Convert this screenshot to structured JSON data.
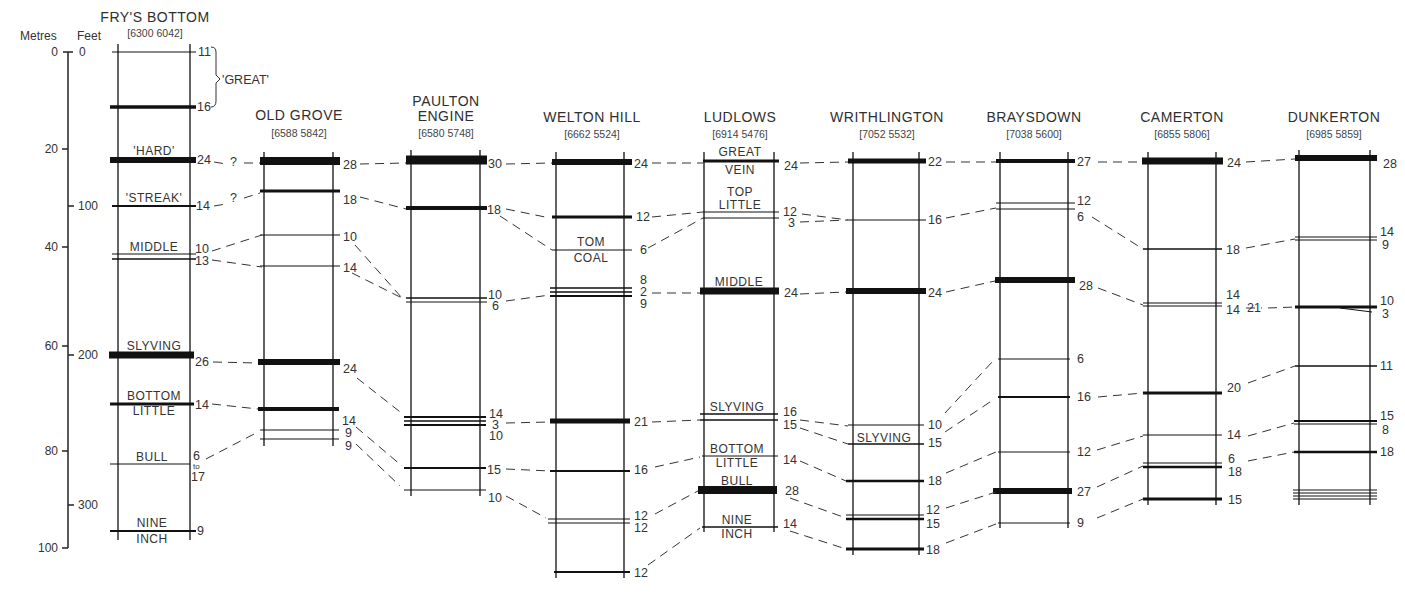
{
  "diagram": {
    "type": "stratigraphic-correlation",
    "scale": {
      "metres_label": "Metres",
      "feet_label": "Feet",
      "metres_ticks": [
        0,
        20,
        40,
        60,
        80,
        100
      ],
      "feet_ticks": [
        0,
        100,
        200,
        300
      ]
    },
    "columns": [
      {
        "id": "frys-bottom",
        "name": "FRY'S BOTTOM",
        "grid_ref": "[6300 6042]",
        "seams": [
          {
            "y": 52,
            "thick": 11,
            "w": 1,
            "label": ""
          },
          {
            "y": 107,
            "thick": 16,
            "w": 3.5,
            "label": ""
          },
          {
            "y": 160,
            "thick": 24,
            "w": 6,
            "label": "'HARD'"
          },
          {
            "y": 206,
            "thick": 14,
            "w": 2,
            "label": "'STREAK'"
          },
          {
            "y": 254,
            "thick": 10,
            "w": 1,
            "label": "MIDDLE"
          },
          {
            "y": 259,
            "thick": 13,
            "w": 1.5,
            "label": ""
          },
          {
            "y": 355,
            "thick": 26,
            "w": 7,
            "label": "SLYVING"
          },
          {
            "y": 404,
            "thick": 14,
            "w": 3,
            "label": "BOTTOM LITTLE"
          },
          {
            "y": 464,
            "thick": "6 to 17",
            "w": 1,
            "label": "BULL"
          },
          {
            "y": 531,
            "thick": 9,
            "w": 2,
            "label": "NINE INCH"
          }
        ],
        "bracket_label": "'GREAT'"
      },
      {
        "id": "old-grove",
        "name": "OLD GROVE",
        "grid_ref": "[6588 5842]",
        "seams": [
          {
            "y": 161,
            "thick": 28,
            "w": 8
          },
          {
            "y": 191,
            "thick": 18,
            "w": 3
          },
          {
            "y": 235,
            "thick": 10,
            "w": 1
          },
          {
            "y": 266,
            "thick": 14,
            "w": 1
          },
          {
            "y": 362,
            "thick": 24,
            "w": 6
          },
          {
            "y": 409,
            "thick": 14,
            "w": 4
          },
          {
            "y": 430,
            "thick": 9,
            "w": 1
          },
          {
            "y": 439,
            "thick": 9,
            "w": 1
          }
        ]
      },
      {
        "id": "paulton-engine",
        "name": "PAULTON ENGINE",
        "grid_ref": "[6580 5748]",
        "seams": [
          {
            "y": 160,
            "thick": 30,
            "w": 9
          },
          {
            "y": 208,
            "thick": 18,
            "w": 4
          },
          {
            "y": 298,
            "thick": 10,
            "w": 1.5
          },
          {
            "y": 301,
            "thick": 6,
            "w": 1
          },
          {
            "y": 417,
            "thick": 14,
            "w": 2
          },
          {
            "y": 421,
            "thick": 3,
            "w": 1.5
          },
          {
            "y": 425,
            "thick": 10,
            "w": 2
          },
          {
            "y": 468,
            "thick": 15,
            "w": 2
          },
          {
            "y": 490,
            "thick": 10,
            "w": 1
          }
        ]
      },
      {
        "id": "welton-hill",
        "name": "WELTON HILL",
        "grid_ref": "[6662 5524]",
        "seams": [
          {
            "y": 162,
            "thick": 24,
            "w": 6
          },
          {
            "y": 217,
            "thick": 12,
            "w": 3
          },
          {
            "y": 250,
            "thick": 6,
            "w": 1,
            "label": "TOM COAL"
          },
          {
            "y": 288,
            "thick": 8,
            "w": 1.5
          },
          {
            "y": 292,
            "thick": 2,
            "w": 1.5
          },
          {
            "y": 296,
            "thick": 9,
            "w": 2
          },
          {
            "y": 421,
            "thick": 21,
            "w": 5
          },
          {
            "y": 471,
            "thick": 16,
            "w": 2
          },
          {
            "y": 519,
            "thick": 12,
            "w": 1
          },
          {
            "y": 523,
            "thick": 12,
            "w": 1
          },
          {
            "y": 572,
            "thick": 12,
            "w": 2
          }
        ]
      },
      {
        "id": "ludlows",
        "name": "LUDLOWS",
        "grid_ref": "[6914 5476]",
        "seams": [
          {
            "y": 161,
            "thick": 24,
            "w": 3,
            "label": "GREAT VEIN"
          },
          {
            "y": 212,
            "thick": 12,
            "w": 1,
            "label": "TOP LITTLE"
          },
          {
            "y": 218,
            "thick": 3,
            "w": 1
          },
          {
            "y": 291,
            "thick": 24,
            "w": 7,
            "label": "MIDDLE"
          },
          {
            "y": 414,
            "thick": 16,
            "w": 1.5,
            "label": "SLYVING"
          },
          {
            "y": 420,
            "thick": 15,
            "w": 1.5
          },
          {
            "y": 456,
            "thick": 14,
            "w": 1,
            "label": "BOTTOM LITTLE"
          },
          {
            "y": 490,
            "thick": 28,
            "w": 8,
            "label": "BULL"
          },
          {
            "y": 527,
            "thick": 14,
            "w": 1.5,
            "label": "NINE INCH"
          }
        ]
      },
      {
        "id": "writhlington",
        "name": "WRITHLINGTON",
        "grid_ref": "[7052 5532]",
        "seams": [
          {
            "y": 161,
            "thick": 22,
            "w": 5
          },
          {
            "y": 220,
            "thick": 16,
            "w": 1
          },
          {
            "y": 291,
            "thick": 24,
            "w": 6
          },
          {
            "y": 425,
            "thick": 10,
            "w": 1
          },
          {
            "y": 444,
            "thick": 15,
            "w": 1.5,
            "label": "SLYVING"
          },
          {
            "y": 481,
            "thick": 18,
            "w": 2.5
          },
          {
            "y": 515,
            "thick": 12,
            "w": 1
          },
          {
            "y": 519,
            "thick": 15,
            "w": 2.5
          },
          {
            "y": 549,
            "thick": 18,
            "w": 3
          }
        ]
      },
      {
        "id": "braysdown",
        "name": "BRAYSDOWN",
        "grid_ref": "[7038 5600]",
        "seams": [
          {
            "y": 161,
            "thick": 27,
            "w": 4
          },
          {
            "y": 203,
            "thick": 12,
            "w": 1
          },
          {
            "y": 209,
            "thick": 6,
            "w": 1
          },
          {
            "y": 280,
            "thick": 28,
            "w": 6
          },
          {
            "y": 359,
            "thick": 6,
            "w": 1
          },
          {
            "y": 397,
            "thick": 16,
            "w": 2
          },
          {
            "y": 452,
            "thick": 12,
            "w": 1
          },
          {
            "y": 491,
            "thick": 27,
            "w": 6
          },
          {
            "y": 523,
            "thick": 9,
            "w": 1
          }
        ]
      },
      {
        "id": "camerton",
        "name": "CAMERTON",
        "grid_ref": "[6855 5806]",
        "seams": [
          {
            "y": 161,
            "thick": 24,
            "w": 7
          },
          {
            "y": 249,
            "thick": 18,
            "w": 1.5
          },
          {
            "y": 303,
            "thick": 14,
            "w": 1
          },
          {
            "y": 306,
            "thick": 14,
            "w": 1
          },
          {
            "y": 393,
            "thick": 20,
            "w": 3
          },
          {
            "y": 435,
            "thick": 14,
            "w": 1
          },
          {
            "y": 463,
            "thick": 6,
            "w": 1
          },
          {
            "y": 467,
            "thick": 18,
            "w": 2.5
          },
          {
            "y": 499,
            "thick": 15,
            "w": 3
          }
        ]
      },
      {
        "id": "dunkerton",
        "name": "DUNKERTON",
        "grid_ref": "[6985 5859]",
        "seams": [
          {
            "y": 158,
            "thick": 28,
            "w": 6
          },
          {
            "y": 238,
            "thick": 14,
            "w": 1
          },
          {
            "y": 240,
            "thick": 9,
            "w": 1
          },
          {
            "y": 307,
            "thick": 10,
            "w": 3
          },
          {
            "y": 310,
            "thick": 3,
            "w": 1
          },
          {
            "y": 366,
            "thick": 11,
            "w": 1.5
          },
          {
            "y": 421,
            "thick": 15,
            "w": 2
          },
          {
            "y": 424,
            "thick": 8,
            "w": 1
          },
          {
            "y": 452,
            "thick": 18,
            "w": 2.5
          },
          {
            "y": 490,
            "thick": null,
            "w": 1
          },
          {
            "y": 493,
            "thick": null,
            "w": 1
          },
          {
            "y": 496,
            "thick": null,
            "w": 1
          },
          {
            "y": 499,
            "thick": null,
            "w": 1
          }
        ]
      }
    ],
    "question_marks": [
      "?",
      "?"
    ]
  }
}
